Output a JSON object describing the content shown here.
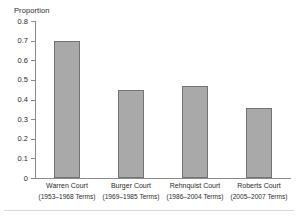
{
  "chart_data": {
    "type": "bar",
    "title": "",
    "xlabel": "",
    "ylabel": "Proportion",
    "ylim": [
      0,
      0.8
    ],
    "grid": false,
    "legend": "none",
    "ytick_labels": [
      "0.8",
      "0.7",
      "0.6",
      "0.5",
      "0.4",
      "0.3",
      "0.2",
      "0.1",
      "0"
    ],
    "ytick_values": [
      0.8,
      0.7,
      0.6,
      0.5,
      0.4,
      0.3,
      0.2,
      0.1,
      0
    ],
    "categories": [
      "Warren Court",
      "Burger Court",
      "Rehnquist Court",
      "Roberts Court"
    ],
    "category_sublabels": [
      "(1953–1968 Terms)",
      "(1969–1985 Terms)",
      "(1986–2004 Terms)",
      "(2005–2007 Terms)"
    ],
    "values": [
      0.7,
      0.45,
      0.47,
      0.355
    ],
    "bar_fill_color": "#a9a9a9",
    "bar_border_color": "#737373",
    "axis_color": "#8a8a8a"
  }
}
